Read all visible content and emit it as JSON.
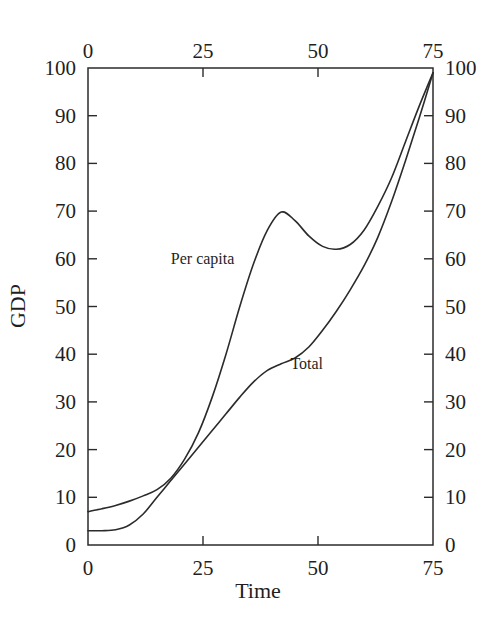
{
  "chart_data": {
    "type": "line",
    "title": "",
    "subtitle": "",
    "xlabel": "Time",
    "ylabel": "GDP",
    "xlim": [
      0,
      75
    ],
    "ylim": [
      0,
      100
    ],
    "grid": false,
    "legend_position": "inline-annotation",
    "x_ticks": [
      0,
      25,
      50,
      75
    ],
    "x_tick_labels": [
      "0",
      "25",
      "50",
      "75"
    ],
    "x_axis_top_labels": [
      "0",
      "25",
      "50",
      "75"
    ],
    "y_ticks": [
      0,
      10,
      20,
      30,
      40,
      50,
      60,
      70,
      80,
      90,
      100
    ],
    "y_tick_labels": [
      "0",
      "10",
      "20",
      "30",
      "40",
      "50",
      "60",
      "70",
      "80",
      "90",
      "100"
    ],
    "y_axis_right_labels": [
      "0",
      "10",
      "20",
      "30",
      "40",
      "50",
      "60",
      "70",
      "80",
      "90",
      "100"
    ],
    "axes_mirrored": true,
    "line_color": "#2b2b2b",
    "background_color": "#ffffff",
    "series": [
      {
        "name": "Per capita",
        "label_position": {
          "x": 18,
          "y": 59
        },
        "points": [
          {
            "x": 0,
            "y": 7.0
          },
          {
            "x": 3,
            "y": 7.6
          },
          {
            "x": 6,
            "y": 8.3
          },
          {
            "x": 9,
            "y": 9.2
          },
          {
            "x": 12,
            "y": 10.3
          },
          {
            "x": 15,
            "y": 11.6
          },
          {
            "x": 18,
            "y": 14.0
          },
          {
            "x": 21,
            "y": 18.0
          },
          {
            "x": 24,
            "y": 23.5
          },
          {
            "x": 27,
            "y": 31.0
          },
          {
            "x": 30,
            "y": 40.0
          },
          {
            "x": 33,
            "y": 50.0
          },
          {
            "x": 36,
            "y": 59.0
          },
          {
            "x": 39,
            "y": 66.0
          },
          {
            "x": 42,
            "y": 69.8
          },
          {
            "x": 45,
            "y": 68.0
          },
          {
            "x": 48,
            "y": 64.8
          },
          {
            "x": 51,
            "y": 62.6
          },
          {
            "x": 54,
            "y": 62.0
          },
          {
            "x": 57,
            "y": 63.0
          },
          {
            "x": 60,
            "y": 66.0
          },
          {
            "x": 63,
            "y": 71.0
          },
          {
            "x": 66,
            "y": 77.0
          },
          {
            "x": 69,
            "y": 84.5
          },
          {
            "x": 72,
            "y": 92.0
          },
          {
            "x": 75,
            "y": 99.0
          }
        ]
      },
      {
        "name": "Total",
        "label_position": {
          "x": 44,
          "y": 37
        },
        "points": [
          {
            "x": 0,
            "y": 3.0
          },
          {
            "x": 3,
            "y": 3.0
          },
          {
            "x": 6,
            "y": 3.2
          },
          {
            "x": 9,
            "y": 4.2
          },
          {
            "x": 12,
            "y": 6.5
          },
          {
            "x": 15,
            "y": 10.0
          },
          {
            "x": 18,
            "y": 13.5
          },
          {
            "x": 21,
            "y": 17.0
          },
          {
            "x": 24,
            "y": 20.5
          },
          {
            "x": 27,
            "y": 24.0
          },
          {
            "x": 30,
            "y": 27.5
          },
          {
            "x": 33,
            "y": 31.0
          },
          {
            "x": 36,
            "y": 34.2
          },
          {
            "x": 39,
            "y": 36.6
          },
          {
            "x": 42,
            "y": 38.0
          },
          {
            "x": 45,
            "y": 39.2
          },
          {
            "x": 48,
            "y": 41.5
          },
          {
            "x": 51,
            "y": 45.0
          },
          {
            "x": 54,
            "y": 49.0
          },
          {
            "x": 57,
            "y": 53.5
          },
          {
            "x": 60,
            "y": 58.5
          },
          {
            "x": 63,
            "y": 64.5
          },
          {
            "x": 66,
            "y": 72.0
          },
          {
            "x": 69,
            "y": 80.5
          },
          {
            "x": 72,
            "y": 89.5
          },
          {
            "x": 75,
            "y": 99.0
          }
        ]
      }
    ],
    "annotations": [
      {
        "text": "Per capita",
        "x": 18,
        "y": 59
      },
      {
        "text": "Total",
        "x": 44,
        "y": 37
      }
    ]
  }
}
